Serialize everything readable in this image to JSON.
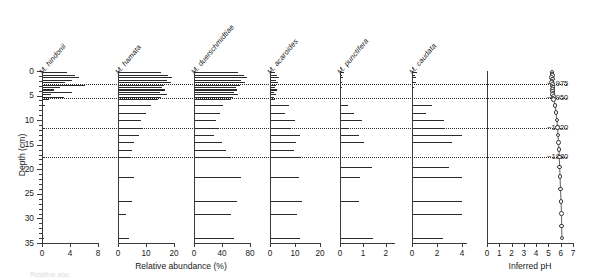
{
  "figure": {
    "y_axis_title": "Depth (cm)",
    "x_axis_title_left": "Relative abundance (%)",
    "x_axis_title_right": "Inferred pH",
    "depth_ticks": [
      0,
      5,
      10,
      15,
      20,
      25,
      30,
      35
    ],
    "depth_range": [
      0,
      35
    ],
    "year_markers": [
      {
        "label": "~1975",
        "depth": 2.7
      },
      {
        "label": "~1950",
        "depth": 5.5
      },
      {
        "label": "~1920",
        "depth": 11.5
      },
      {
        "label": "~1880",
        "depth": 17.5
      }
    ],
    "marker_depths": [
      2.7,
      5.5,
      11.5,
      17.5
    ]
  },
  "chart_data": {
    "type": "bar",
    "title": "",
    "xlabel": "Relative abundance (%)",
    "ylabel": "Depth (cm)",
    "ylim": [
      0,
      35
    ],
    "grid": false,
    "legend": "none",
    "orientation": "horizontal-stratigraphic",
    "depths": [
      0.25,
      0.75,
      1.25,
      1.75,
      2.25,
      2.75,
      3.25,
      3.75,
      4.25,
      4.75,
      5.25,
      5.75,
      7.0,
      8.5,
      10.0,
      11.5,
      13.0,
      14.5,
      16.0,
      17.5,
      19.5,
      21.5,
      24.0,
      26.5,
      29.0,
      31.5,
      34.0
    ],
    "panels": [
      {
        "name": "M. hindonii",
        "xlim": [
          0,
          8
        ],
        "xticks": [
          0,
          4,
          8
        ],
        "values": [
          3.4,
          4.6,
          5.2,
          4.1,
          3.2,
          6.0,
          2.4,
          1.5,
          4.2,
          1.1,
          3.0,
          0.8,
          0.25,
          0.0,
          0.0,
          0.35,
          0.0,
          0.0,
          0.0,
          0.1,
          0.0,
          0.0,
          0.0,
          0.0,
          0.0,
          0.0,
          0.15
        ]
      },
      {
        "name": "M. hamata",
        "xlim": [
          0,
          20
        ],
        "xticks": [
          0,
          10,
          20
        ],
        "values": [
          15.0,
          17.5,
          19.0,
          17.0,
          18.5,
          16.0,
          15.5,
          16.5,
          14.5,
          17.0,
          15.0,
          14.0,
          11.5,
          9.5,
          8.0,
          8.5,
          7.0,
          5.5,
          4.5,
          4.0,
          0.0,
          5.5,
          0.0,
          4.5,
          2.5,
          0.0,
          3.5
        ]
      },
      {
        "name": "M. duerschmidtiae",
        "xlim": [
          0,
          80
        ],
        "xticks": [
          0,
          40,
          80
        ],
        "values": [
          62,
          70,
          74,
          66,
          72,
          64,
          58,
          60,
          56,
          62,
          54,
          52,
          40,
          36,
          30,
          34,
          27,
          38,
          44,
          50,
          0,
          66,
          0,
          60,
          52,
          0,
          56
        ]
      },
      {
        "name": "M. acaroides",
        "xlim": [
          0,
          20
        ],
        "xticks": [
          0,
          10,
          20
        ],
        "values": [
          1.6,
          2.4,
          3.0,
          2.0,
          2.6,
          1.8,
          1.4,
          2.2,
          1.2,
          1.8,
          1.0,
          1.4,
          7.0,
          5.5,
          9.5,
          8.0,
          11.5,
          10.0,
          9.0,
          12.0,
          0.0,
          11.0,
          0.0,
          12.5,
          10.5,
          0.0,
          11.5
        ]
      },
      {
        "name": "M. punctifera",
        "xlim": [
          0,
          2.4
        ],
        "xticks": [
          0,
          1,
          2
        ],
        "values": [
          0.12,
          0.05,
          0.08,
          0.0,
          0.06,
          0.0,
          0.04,
          0.0,
          0.0,
          0.0,
          0.0,
          0.0,
          0.3,
          0.55,
          0.9,
          0.35,
          0.8,
          1.0,
          0.0,
          0.0,
          1.35,
          0.85,
          0.0,
          0.8,
          0.0,
          0.0,
          1.4
        ]
      },
      {
        "name": "M. caudata",
        "xlim": [
          0,
          4.4
        ],
        "xticks": [
          0,
          2,
          4
        ],
        "values": [
          0.35,
          0.15,
          0.25,
          0.0,
          0.2,
          0.0,
          0.1,
          0.0,
          0.0,
          0.0,
          0.0,
          0.0,
          1.5,
          1.0,
          2.5,
          2.5,
          3.9,
          3.1,
          0.0,
          0.0,
          2.9,
          3.9,
          0.0,
          3.9,
          3.9,
          0.0,
          2.4
        ]
      }
    ],
    "ph_panel": {
      "name": "Inferred pH",
      "xlim": [
        0,
        7
      ],
      "xticks": [
        0,
        1,
        2,
        3,
        4,
        5,
        6,
        7
      ],
      "xlabel": "Inferred pH",
      "depths": [
        0.25,
        0.6,
        0.95,
        1.3,
        1.65,
        2.0,
        2.35,
        2.7,
        3.05,
        3.4,
        3.75,
        4.1,
        4.45,
        4.8,
        5.15,
        5.5,
        5.85,
        7.0,
        8.5,
        10.0,
        11.5,
        13.0,
        14.5,
        16.0,
        17.5,
        19.5,
        21.5,
        24.0,
        26.5,
        29.0,
        31.5,
        34.0
      ],
      "values": [
        5.3,
        5.28,
        5.32,
        5.27,
        5.34,
        5.3,
        5.26,
        5.33,
        5.29,
        5.36,
        5.31,
        5.35,
        5.38,
        5.34,
        5.4,
        5.37,
        5.42,
        5.55,
        5.62,
        5.7,
        5.74,
        5.78,
        5.82,
        5.86,
        5.88,
        5.92,
        5.94,
        5.98,
        6.02,
        6.06,
        6.08,
        6.1
      ]
    }
  },
  "caption_fragment": "Relative abu"
}
